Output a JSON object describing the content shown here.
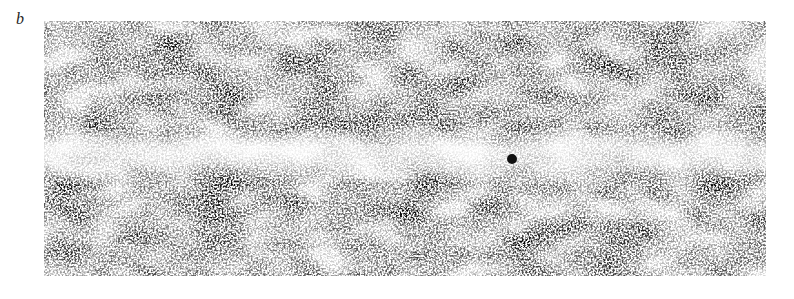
{
  "figure": {
    "panel_label": "b",
    "image": {
      "description": "Grayscale noisy micrograph with a lighter horizontal band across the middle and a small dark particle",
      "band_color": "#f4f4f4",
      "particle_color": "#111111"
    }
  }
}
